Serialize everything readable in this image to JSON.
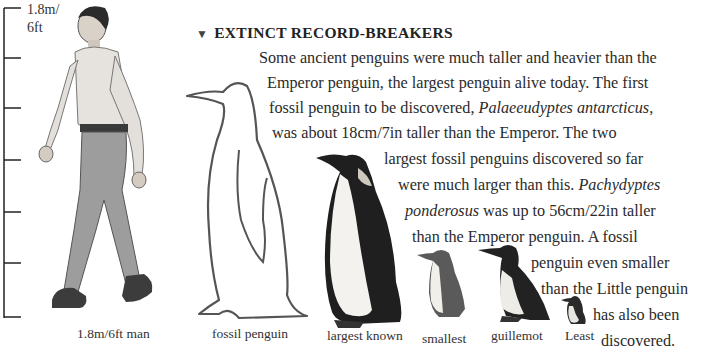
{
  "scale": {
    "top_label_line1": "1.8m/",
    "top_label_line2": "6ft",
    "ticks": 6
  },
  "section": {
    "heading": "EXTINCT RECORD-BREAKERS",
    "lines": [
      {
        "pre": "Some ancient penguins were much taller and heavier than the",
        "em": "",
        "post": ""
      },
      {
        "pre": "Emperor penguin, the largest penguin alive today. The first",
        "em": "",
        "post": ""
      },
      {
        "pre": "fossil penguin to be discovered, ",
        "em": "Palaeeudyptes antarcticus",
        "post": ","
      },
      {
        "pre": "was about 18cm/7in taller than the Emperor. The two",
        "em": "",
        "post": ""
      },
      {
        "pre": "largest fossil penguins discovered so far",
        "em": "",
        "post": ""
      },
      {
        "pre": "were much larger than this. ",
        "em": "Pachydyptes",
        "post": ""
      },
      {
        "pre": "",
        "em": "ponderosus",
        "post": " was up to 56cm/22in taller"
      },
      {
        "pre": "than the Emperor penguin. A fossil",
        "em": "",
        "post": ""
      },
      {
        "pre": "penguin even smaller",
        "em": "",
        "post": ""
      },
      {
        "pre": "than the Little penguin",
        "em": "",
        "post": ""
      },
      {
        "pre": "has also been",
        "em": "",
        "post": ""
      },
      {
        "pre": "discovered.",
        "em": "",
        "post": ""
      }
    ]
  },
  "captions": {
    "man": "1.8m/6ft man",
    "fossil": "fossil penguin",
    "largest": "largest known",
    "smallest": "smallest",
    "guillemot": "guillemot",
    "least": "Least"
  }
}
